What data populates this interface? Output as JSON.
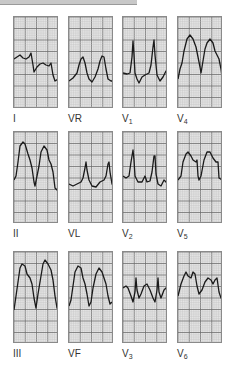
{
  "figure": {
    "type": "12-lead ECG strips",
    "grid": {
      "major_cols": 4,
      "major_rows": 8,
      "minor_per_major": 5,
      "background": "#e4e4e4",
      "minor_color": "#c2c2c2",
      "major_color": "#6e6e6e",
      "trace_color": "#1a1a1a"
    },
    "leads": [
      {
        "id": "I",
        "label": "I",
        "sub": "",
        "x": 13,
        "y": 16,
        "path": "M0,42 L3,40 L6,38 L9,41 L12,42 L15,40 L17,36 L19,48 L20,55 L23,50 L26,47 L29,46 L32,48 L35,49 L37,46 L39,58 L41,64 L44,62 L46,55 L45,56"
      },
      {
        "id": "VR",
        "label": "VR",
        "sub": "",
        "x": 68,
        "y": 16,
        "path": "M0,64 L4,61 L8,56 L10,48 L12,42 L14,40 L16,46 L18,56 L20,62 L23,65 L26,60 L29,52 L31,44 L33,39 L35,40 L37,52 L39,62 L42,64 L45,64"
      },
      {
        "id": "V1",
        "label": "V",
        "sub": "1",
        "x": 122,
        "y": 16,
        "path": "M0,56 L4,57 L7,56 L9,40 L10,24 L11,38 L12,56 L14,62 L16,66 L19,60 L22,58 L26,56 L28,48 L30,30 L31,23 L32,38 L34,58 L37,64 L40,60 L43,54 L45,53"
      },
      {
        "id": "V4",
        "label": "V",
        "sub": "4",
        "x": 177,
        "y": 16,
        "path": "M0,62 L2,52 L4,46 L6,34 L9,22 L12,18 L15,22 L18,30 L20,40 L22,50 L23,56 L25,44 L27,32 L29,26 L32,22 L35,26 L37,34 L39,38 L41,42 L43,52 L44,60 L45,48"
      }
    ],
    "leads_row2": [
      {
        "id": "II",
        "label": "II",
        "sub": "",
        "x": 13,
        "y": 131,
        "path": "M0,48 L2,44 L4,30 L6,14 L9,10 L11,12 L14,22 L16,28 L18,36 L20,50 L21,54 L23,44 L25,34 L27,20 L30,14 L33,18 L35,28 L37,32 L39,40 L41,56 L43,58 L45,54"
      },
      {
        "id": "VL",
        "label": "VL",
        "sub": "",
        "x": 68,
        "y": 131,
        "path": "M0,52 L4,54 L8,52 L12,50 L14,46 L16,36 L17,30 L18,38 L20,48 L23,54 L27,55 L31,50 L35,48 L37,44 L39,32 L40,30 L41,40 L43,52 L45,54"
      },
      {
        "id": "V2",
        "label": "V",
        "sub": "2",
        "x": 122,
        "y": 131,
        "path": "M0,44 L3,46 L6,44 L8,30 L10,18 L11,28 L12,44 L15,50 L19,50 L22,44 L24,50 L27,49 L29,40 L31,24 L32,24 L33,42 L35,52 L38,54 L41,48 L43,50 L45,52"
      },
      {
        "id": "V5",
        "label": "V",
        "sub": "5",
        "x": 177,
        "y": 131,
        "path": "M0,48 L3,44 L5,30 L8,22 L10,20 L13,24 L15,28 L18,30 L19,28 L20,44 L21,48 L23,44 L26,28 L29,20 L32,20 L35,26 L38,30 L40,30 L41,46 L44,48"
      }
    ],
    "leads_row3": [
      {
        "id": "III",
        "label": "III",
        "sub": "",
        "x": 13,
        "y": 251,
        "path": "M0,58 L2,44 L4,30 L6,16 L8,12 L11,14 L13,22 L16,26 L18,32 L20,46 L22,56 L24,42 L26,30 L29,12 L31,8 L34,12 L37,18 L39,28 L41,44 L43,56 L45,58"
      },
      {
        "id": "VF",
        "label": "VF",
        "sub": "",
        "x": 68,
        "y": 251,
        "path": "M0,54 L2,48 L4,34 L6,20 L9,14 L12,16 L14,26 L16,32 L18,42 L20,54 L22,50 L24,36 L27,22 L30,16 L33,20 L35,26 L37,32 L39,44 L41,52 L43,50"
      },
      {
        "id": "V3",
        "label": "V",
        "sub": "3",
        "x": 122,
        "y": 251,
        "path": "M0,36 L3,34 L5,36 L8,44 L10,50 L12,40 L13,26 L14,38 L16,46 L18,42 L21,34 L24,32 L27,38 L30,46 L32,50 L34,38 L35,26 L36,40 L38,46 L41,38 L45,34"
      },
      {
        "id": "V6",
        "label": "V",
        "sub": "6",
        "x": 177,
        "y": 251,
        "path": "M0,44 L3,32 L6,24 L8,20 L10,24 L13,26 L15,20 L17,22 L19,34 L21,42 L24,38 L27,30 L30,26 L33,28 L35,32 L37,28 L39,26 L41,40 L43,46 L45,46"
      }
    ]
  }
}
